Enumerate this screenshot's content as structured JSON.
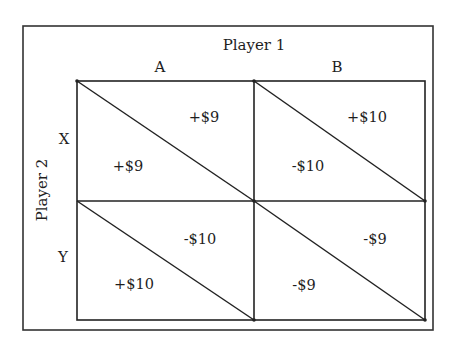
{
  "diagram": {
    "type": "payoff-matrix",
    "column_player": {
      "label": "Player 1",
      "strategies": [
        "A",
        "B"
      ]
    },
    "row_player": {
      "label": "Player 2",
      "strategies": [
        "X",
        "Y"
      ]
    },
    "cells": [
      {
        "row": "X",
        "col": "A",
        "player1_payoff": "+$9",
        "player2_payoff": "+$9"
      },
      {
        "row": "X",
        "col": "B",
        "player1_payoff": "+$10",
        "player2_payoff": "-$10"
      },
      {
        "row": "Y",
        "col": "A",
        "player1_payoff": "-$10",
        "player2_payoff": "+$10"
      },
      {
        "row": "Y",
        "col": "B",
        "player1_payoff": "-$9",
        "player2_payoff": "-$9"
      }
    ],
    "colors": {
      "line": "#222222",
      "text": "#1e1e1e",
      "background": "#ffffff"
    }
  }
}
